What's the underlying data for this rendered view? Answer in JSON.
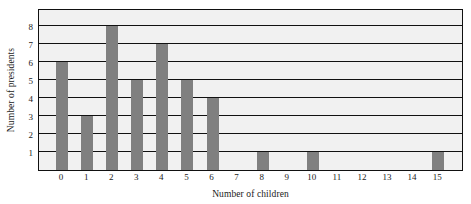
{
  "chart_data": {
    "type": "bar",
    "title": "",
    "xlabel": "Number of children",
    "ylabel": "Number of presidents",
    "categories": [
      "0",
      "1",
      "2",
      "3",
      "4",
      "5",
      "6",
      "7",
      "8",
      "9",
      "10",
      "11",
      "12",
      "13",
      "14",
      "15"
    ],
    "values": [
      6,
      3,
      8,
      5,
      7,
      5,
      4,
      0,
      1,
      0,
      1,
      0,
      0,
      0,
      0,
      1
    ],
    "ytick_labels": [
      "1",
      "2",
      "3",
      "4",
      "5",
      "6",
      "7",
      "8"
    ],
    "ytick_values": [
      1,
      2,
      3,
      4,
      5,
      6,
      7,
      8
    ],
    "ylim": [
      0,
      9
    ],
    "xlim_categories": 16,
    "grid": true,
    "grid_axis": "y",
    "legend": null,
    "colors": {
      "bar": "#808080",
      "plot_background": "#f1f1f1",
      "gridline": "#111111",
      "frame": "#111111",
      "text": "#1a1a1a",
      "page_background": "#ffffff"
    }
  }
}
